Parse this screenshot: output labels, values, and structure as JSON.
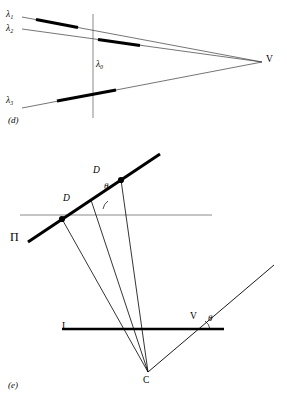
{
  "figure": {
    "panels": [
      {
        "id": "d",
        "caption": "(d)",
        "vertex_label": "V",
        "axis_label_lambda0": "λ₀",
        "rays": [
          {
            "label": "λ₁",
            "subscript": "1"
          },
          {
            "label": "λ₂",
            "subscript": "2"
          },
          {
            "label": "λ₃",
            "subscript": "3"
          }
        ]
      },
      {
        "id": "e",
        "caption": "(e)",
        "plane_label": "Π",
        "image_line_label": "I",
        "center_label": "C",
        "vanishing_point_label": "V",
        "distance_labels": [
          "D",
          "D"
        ],
        "angle_labels": [
          "θ",
          "θ"
        ]
      }
    ],
    "colors": {
      "ink": "#000000",
      "thin_line": "#3a3a3a",
      "gray_line": "#8a8a8a",
      "background": "#ffffff"
    }
  }
}
